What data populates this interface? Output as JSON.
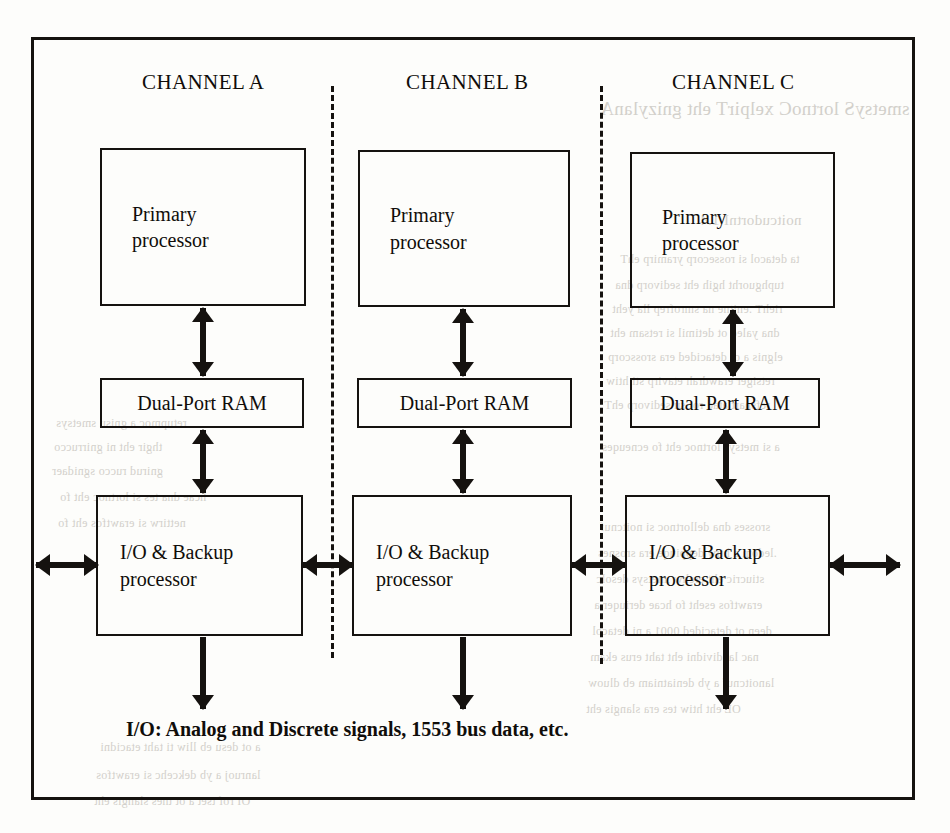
{
  "diagram": {
    "title_visible": false,
    "channels": [
      {
        "header": "CHANNEL A"
      },
      {
        "header": "CHANNEL B"
      },
      {
        "header": "CHANNEL C"
      }
    ],
    "block_labels": {
      "primary_processor": "Primary\nprocessor",
      "dual_port_ram": "Dual-Port RAM",
      "io_backup_processor": "I/O & Backup\nprocessor"
    },
    "caption": "I/O: Analog and Discrete signals, 1553 bus data, etc.",
    "colors": {
      "ink": "#15120f",
      "paper": "#fdfdfb",
      "bleed_through": "#b9b5ae"
    }
  },
  "bleed_through": {
    "note": "faint mirrored text showing through from the reverse side of the scanned page",
    "lines": [
      {
        "text": "smetsyS lortnoC xelpirT eht gnizylanA",
        "x": 600,
        "y": 98,
        "size": "lg"
      },
      {
        "text": "noitcudortnI   1.4",
        "x": 700,
        "y": 212,
        "size": "md"
      },
      {
        "text": "ta detacol si rossecorp yramirp ehT",
        "x": 620,
        "y": 252,
        "size": "sm"
      },
      {
        "text": "tuphguorht hgih eht sedivorp dna",
        "x": 615,
        "y": 278,
        "size": "sm"
      },
      {
        "text": "riehT .enitne na smrofrep lla yeht",
        "x": 612,
        "y": 302,
        "size": "sm"
      },
      {
        "text": "dna yaled ot detimil si retsam eht",
        "x": 610,
        "y": 326,
        "size": "sm"
      },
      {
        "text": "elgnis a ot detacided era srosscorp",
        "x": 608,
        "y": 350,
        "size": "sm"
      },
      {
        "text": "retsiger erawdrah etavirp sti htiw",
        "x": 606,
        "y": 374,
        "size": "sm"
      },
      {
        "text": "refsnart atad rof su sedivorp ehT",
        "x": 604,
        "y": 398,
        "size": "sm"
      },
      {
        "text": "a si metsys lortnoc eht fo ecneuqes",
        "x": 602,
        "y": 440,
        "size": "sm"
      },
      {
        "text": "srosses dna dellortnoc si noitcnuf",
        "x": 600,
        "y": 520,
        "size": "sm"
      },
      {
        "text": ".ledom a htiw deppiuqe era srosnes",
        "x": 598,
        "y": 546,
        "size": "sm"
      },
      {
        "text": "stiucric eht erehw ,metsys desolc",
        "x": 596,
        "y": 572,
        "size": "sm"
      },
      {
        "text": "erawtfos eseht fo hcae deriuqer a",
        "x": 594,
        "y": 598,
        "size": "sm"
      },
      {
        "text": "deen ot detacided 0001 a ni detacol",
        "x": 592,
        "y": 624,
        "size": "sm"
      },
      {
        "text": "nac laudividni eht taht erus ekam",
        "x": 590,
        "y": 650,
        "size": "sm"
      },
      {
        "text": "lanoitcnuf a yb deniatniam eb dluow",
        "x": 588,
        "y": 676,
        "size": "sm"
      },
      {
        "text": "OL eht htiw tes era slangis eht",
        "x": 586,
        "y": 702,
        "size": "sm"
      },
      {
        "text": "a ot desu eb lliw ti taht etacidni",
        "x": 100,
        "y": 740,
        "size": "sm"
      },
      {
        "text": "lanruoj a yb dekcehc si erawtfos",
        "x": 96,
        "y": 768,
        "size": "sm"
      },
      {
        "text": "OI rof tset a ot tnes slangis eht",
        "x": 94,
        "y": 794,
        "size": "sm"
      },
      {
        "text": "hcae dna tes si lortnoc eht fo",
        "x": 60,
        "y": 490,
        "size": "sm"
      },
      {
        "text": "nettirw si erawtfos eht fo",
        "x": 58,
        "y": 516,
        "size": "sm"
      },
      {
        "text": "retupmoc a gnisu smetsys",
        "x": 56,
        "y": 416,
        "size": "sm"
      },
      {
        "text": "thgir eht ni gnirrucco",
        "x": 54,
        "y": 440,
        "size": "sm"
      },
      {
        "text": "gnirud ruccо sgnidaer",
        "x": 52,
        "y": 464,
        "size": "sm"
      }
    ]
  },
  "layout": {
    "frame": {
      "left": 31,
      "top": 37,
      "width": 884,
      "height": 763
    },
    "headers": [
      {
        "label": "CHANNEL A",
        "left": 142,
        "top": 70
      },
      {
        "label": "CHANNEL B",
        "left": 406,
        "top": 70
      },
      {
        "label": "CHANNEL C",
        "left": 672,
        "top": 70
      }
    ],
    "dividers": [
      {
        "left": 331,
        "top": 86,
        "height": 572
      },
      {
        "left": 600,
        "top": 86,
        "height": 578
      }
    ],
    "boxes": [
      {
        "kind": "proc",
        "label": "primary_processor",
        "left": 100,
        "top": 148,
        "width": 206,
        "height": 158
      },
      {
        "kind": "ram",
        "label": "dual_port_ram",
        "left": 100,
        "top": 378,
        "width": 204,
        "height": 50
      },
      {
        "kind": "io",
        "label": "io_backup_processor",
        "left": 96,
        "top": 495,
        "width": 207,
        "height": 141
      },
      {
        "kind": "proc",
        "label": "primary_processor",
        "left": 358,
        "top": 150,
        "width": 212,
        "height": 157
      },
      {
        "kind": "ram",
        "label": "dual_port_ram",
        "left": 357,
        "top": 378,
        "width": 215,
        "height": 50
      },
      {
        "kind": "io",
        "label": "io_backup_processor",
        "left": 352,
        "top": 495,
        "width": 220,
        "height": 141
      },
      {
        "kind": "proc",
        "label": "primary_processor",
        "left": 630,
        "top": 152,
        "width": 205,
        "height": 156
      },
      {
        "kind": "ram",
        "label": "dual_port_ram",
        "left": 630,
        "top": 378,
        "width": 190,
        "height": 50
      },
      {
        "kind": "io",
        "label": "io_backup_processor",
        "left": 625,
        "top": 495,
        "width": 205,
        "height": 141
      }
    ],
    "v_arrows": [
      {
        "left": 203,
        "top": 308,
        "height": 68
      },
      {
        "left": 203,
        "top": 430,
        "height": 63
      },
      {
        "left": 463,
        "top": 309,
        "height": 67
      },
      {
        "left": 463,
        "top": 430,
        "height": 63
      },
      {
        "left": 733,
        "top": 310,
        "height": 66
      },
      {
        "left": 726,
        "top": 430,
        "height": 63
      }
    ],
    "h_arrows": [
      {
        "left": 36,
        "top": 565,
        "width": 62
      },
      {
        "left": 303,
        "top": 565,
        "width": 50
      },
      {
        "left": 572,
        "top": 565,
        "width": 54
      },
      {
        "left": 830,
        "top": 565,
        "width": 70
      }
    ],
    "down_arrows": [
      {
        "left": 203,
        "top": 637,
        "height": 72
      },
      {
        "left": 463,
        "top": 637,
        "height": 72
      },
      {
        "left": 726,
        "top": 637,
        "height": 72
      }
    ]
  }
}
